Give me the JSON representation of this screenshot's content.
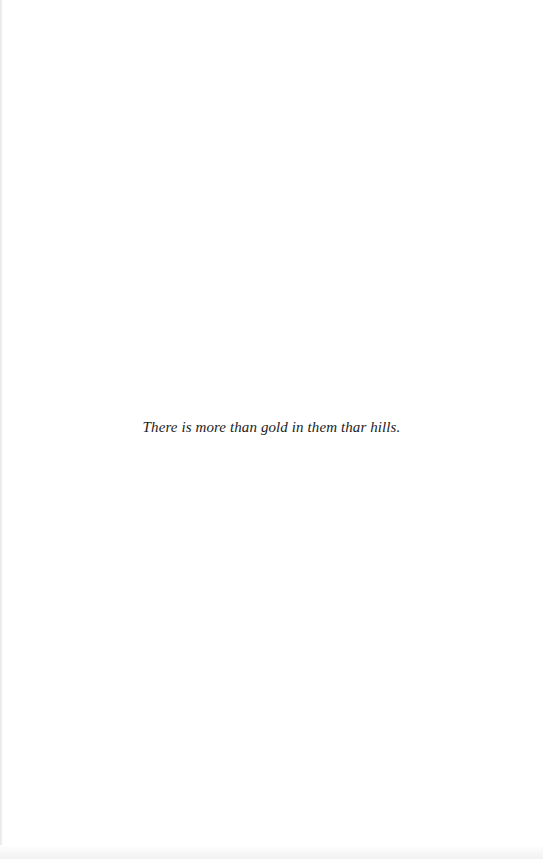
{
  "page": {
    "epigraph": "There is more than gold in them thar hills."
  }
}
